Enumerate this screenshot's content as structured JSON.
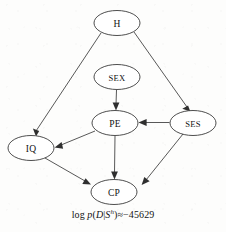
{
  "figure": {
    "type": "directed-acyclic-graph",
    "title": "",
    "background_color": "#fdfdfc",
    "stroke_color": "#3a3a3a",
    "text_color": "#121212"
  },
  "nodes": [
    {
      "id": "H",
      "label": "H",
      "cx": 117,
      "cy": 23,
      "rx": 23,
      "ry": 12.5
    },
    {
      "id": "SEX",
      "label": "SEX",
      "cx": 117,
      "cy": 77,
      "rx": 23,
      "ry": 12.5
    },
    {
      "id": "PE",
      "label": "PE",
      "cx": 115,
      "cy": 123,
      "rx": 23,
      "ry": 12.5
    },
    {
      "id": "SES",
      "label": "SES",
      "cx": 193,
      "cy": 123,
      "rx": 23,
      "ry": 12.5
    },
    {
      "id": "IQ",
      "label": "IQ",
      "cx": 31,
      "cy": 148,
      "rx": 23,
      "ry": 12.5
    },
    {
      "id": "CP",
      "label": "CP",
      "cx": 114,
      "cy": 192,
      "rx": 23,
      "ry": 12.5
    }
  ],
  "edges": [
    {
      "from": "H",
      "to": "IQ",
      "label": ""
    },
    {
      "from": "H",
      "to": "SES",
      "label": ""
    },
    {
      "from": "SEX",
      "to": "PE",
      "label": ""
    },
    {
      "from": "SES",
      "to": "PE",
      "label": ""
    },
    {
      "from": "PE",
      "to": "IQ",
      "label": ""
    },
    {
      "from": "PE",
      "to": "CP",
      "label": ""
    },
    {
      "from": "IQ",
      "to": "CP",
      "label": ""
    },
    {
      "from": "SES",
      "to": "CP",
      "label": ""
    }
  ],
  "caption": {
    "full_text": "log p(D|S^h)≈−45629",
    "log_token": "log",
    "p_token": "p",
    "open_paren": "(",
    "d_token": "D",
    "bar": "|",
    "s_token": "S",
    "s_superscript": "h",
    "close_paren": ")",
    "approx": "≈",
    "value": "−45629"
  }
}
